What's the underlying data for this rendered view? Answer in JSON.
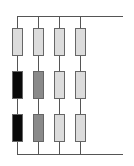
{
  "diagram": {
    "type": "resistor-grid",
    "columns": 4,
    "rows": 3,
    "colors": {
      "black": "#0a0a0a",
      "gray": "#8a8a8a",
      "light": "#dcdcdc",
      "wire": "#555555"
    },
    "cells": [
      [
        "light",
        "light",
        "light",
        "light"
      ],
      [
        "black",
        "gray",
        "light",
        "light"
      ],
      [
        "black",
        "gray",
        "light",
        "light"
      ]
    ]
  }
}
